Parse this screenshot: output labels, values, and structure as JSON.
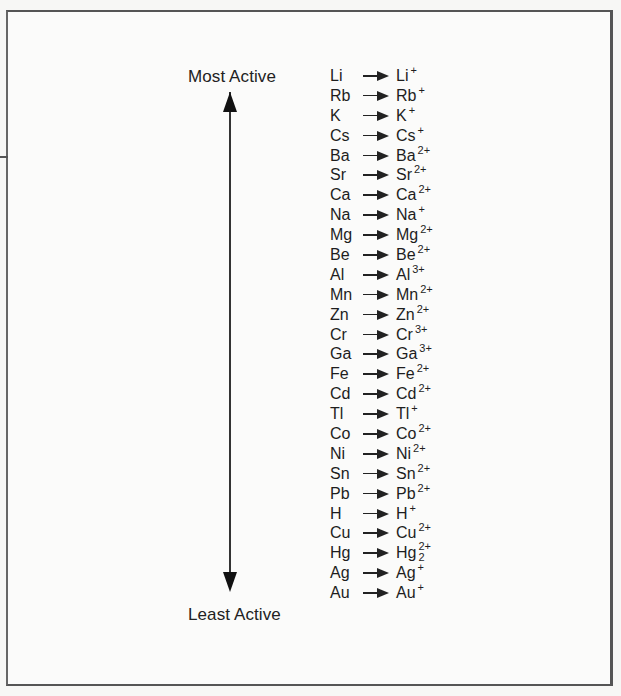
{
  "figure": {
    "labels": {
      "top": "Most Active",
      "bottom": "Least Active"
    },
    "arrow": "double-headed-vertical-arrow",
    "reactions": [
      {
        "metal": "Li",
        "ion": "Li",
        "charge": "+"
      },
      {
        "metal": "Rb",
        "ion": "Rb",
        "charge": "+"
      },
      {
        "metal": "K",
        "ion": "K",
        "charge": "+"
      },
      {
        "metal": "Cs",
        "ion": "Cs",
        "charge": "+"
      },
      {
        "metal": "Ba",
        "ion": "Ba",
        "charge": "2+"
      },
      {
        "metal": "Sr",
        "ion": "Sr",
        "charge": "2+"
      },
      {
        "metal": "Ca",
        "ion": "Ca",
        "charge": "2+"
      },
      {
        "metal": "Na",
        "ion": "Na",
        "charge": "+"
      },
      {
        "metal": "Mg",
        "ion": "Mg",
        "charge": "2+"
      },
      {
        "metal": "Be",
        "ion": "Be",
        "charge": "2+"
      },
      {
        "metal": "Al",
        "ion": "Al",
        "charge": "3+"
      },
      {
        "metal": "Mn",
        "ion": "Mn",
        "charge": "2+"
      },
      {
        "metal": "Zn",
        "ion": "Zn",
        "charge": "2+"
      },
      {
        "metal": "Cr",
        "ion": "Cr",
        "charge": "3+"
      },
      {
        "metal": "Ga",
        "ion": "Ga",
        "charge": "3+"
      },
      {
        "metal": "Fe",
        "ion": "Fe",
        "charge": "2+"
      },
      {
        "metal": "Cd",
        "ion": "Cd",
        "charge": "2+"
      },
      {
        "metal": "Tl",
        "ion": "Tl",
        "charge": "+"
      },
      {
        "metal": "Co",
        "ion": "Co",
        "charge": "2+"
      },
      {
        "metal": "Ni",
        "ion": "Ni",
        "charge": "2+"
      },
      {
        "metal": "Sn",
        "ion": "Sn",
        "charge": "2+"
      },
      {
        "metal": "Pb",
        "ion": "Pb",
        "charge": "2+"
      },
      {
        "metal": "H",
        "ion": "H",
        "charge": "+"
      },
      {
        "metal": "Cu",
        "ion": "Cu",
        "charge": "2+"
      },
      {
        "metal": "Hg",
        "ion": "Hg",
        "charge": "2+",
        "subscript": "2"
      },
      {
        "metal": "Ag",
        "ion": "Ag",
        "charge": "+"
      },
      {
        "metal": "Au",
        "ion": "Au",
        "charge": "+"
      }
    ]
  }
}
